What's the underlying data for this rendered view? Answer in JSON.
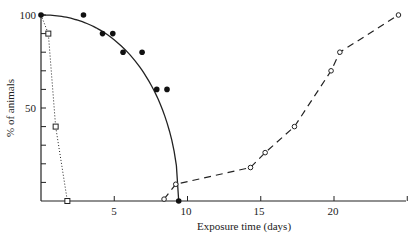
{
  "chart_data": {
    "type": "scatter",
    "title": "",
    "xlabel": "Exposure time (days)",
    "ylabel": "% of animals",
    "xlim": [
      0,
      25
    ],
    "ylim": [
      0,
      100
    ],
    "xticks": [
      5,
      10,
      15,
      20
    ],
    "yticks": [
      50,
      100
    ],
    "grid": false,
    "legend": null,
    "series": [
      {
        "name": "filled circles (solid curve)",
        "marker": "filled-circle",
        "line": "solid",
        "points": [
          [
            0,
            100
          ],
          [
            2.9,
            100
          ],
          [
            4.2,
            90
          ],
          [
            4.9,
            90
          ],
          [
            5.6,
            80
          ],
          [
            6.9,
            80
          ],
          [
            7.9,
            60
          ],
          [
            8.6,
            60
          ],
          [
            9.4,
            0
          ]
        ]
      },
      {
        "name": "open squares (dotted curve)",
        "marker": "open-square",
        "line": "dotted",
        "points": [
          [
            0,
            100
          ],
          [
            0.5,
            90
          ],
          [
            1.0,
            40
          ],
          [
            1.8,
            0
          ]
        ]
      },
      {
        "name": "open circles (dashed curve)",
        "marker": "open-circle",
        "line": "dashed",
        "points": [
          [
            8.4,
            1
          ],
          [
            9.2,
            9
          ],
          [
            14.3,
            18
          ],
          [
            15.3,
            26
          ],
          [
            17.3,
            40
          ],
          [
            19.8,
            70
          ],
          [
            20.4,
            80
          ],
          [
            24.4,
            100
          ]
        ]
      }
    ]
  },
  "labels": {
    "y100": "100",
    "y50": "50",
    "x5": "5",
    "x10": "10",
    "x15": "15",
    "x20": "20",
    "xlabel": "Exposure time (days)",
    "ylabel": "% of animals"
  }
}
